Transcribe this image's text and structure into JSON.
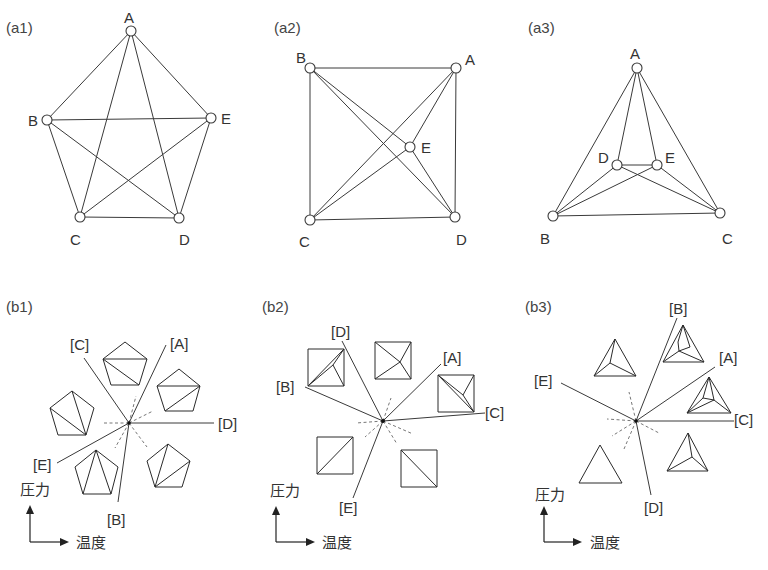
{
  "figure": {
    "panels": {
      "a1": {
        "label": "(a1)",
        "nodes": {
          "A": "A",
          "B": "B",
          "C": "C",
          "D": "D",
          "E": "E"
        }
      },
      "a2": {
        "label": "(a2)",
        "nodes": {
          "A": "A",
          "B": "B",
          "C": "C",
          "D": "D",
          "E": "E"
        }
      },
      "a3": {
        "label": "(a3)",
        "nodes": {
          "A": "A",
          "B": "B",
          "C": "C",
          "D": "D",
          "E": "E"
        }
      },
      "b1": {
        "label": "(b1)",
        "rays": {
          "A": "[A]",
          "B": "[B]",
          "C": "[C]",
          "D": "[D]",
          "E": "[E]"
        }
      },
      "b2": {
        "label": "(b2)",
        "rays": {
          "A": "[A]",
          "B": "[B]",
          "C": "[C]",
          "D": "[D]",
          "E": "[E]"
        }
      },
      "b3": {
        "label": "(b3)",
        "rays": {
          "A": "[A]",
          "B": "[B]",
          "C": "[C]",
          "D": "[D]",
          "E": "[E]"
        }
      }
    },
    "axes": {
      "y_label": "圧力",
      "x_label": "温度"
    }
  }
}
